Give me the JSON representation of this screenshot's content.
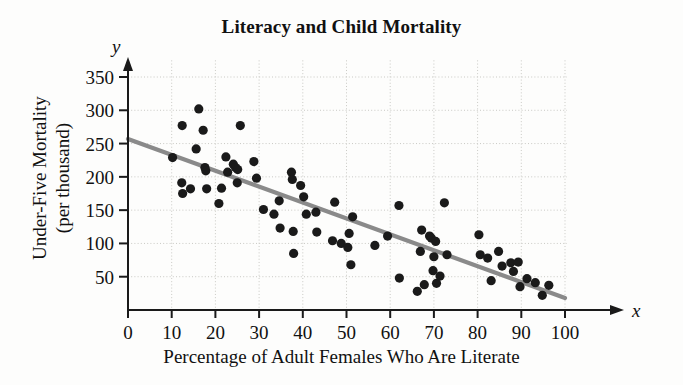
{
  "chart_data": {
    "type": "scatter",
    "title": "Literacy and Child Mortality",
    "xlabel": "Percentage of Adult Females Who Are Literate",
    "ylabel_line1": "Under-Five Mortality",
    "ylabel_line2": "(per thousand)",
    "x_var_symbol": "x",
    "y_var_symbol": "y",
    "xlim": [
      0,
      100
    ],
    "ylim": [
      0,
      375
    ],
    "xticks": [
      0,
      10,
      20,
      30,
      40,
      50,
      60,
      70,
      80,
      90,
      100
    ],
    "yticks": [
      50,
      100,
      150,
      200,
      250,
      300,
      350
    ],
    "grid": true,
    "grid_style": "dotted",
    "point_color": "#1a1a1a",
    "trendline_color": "#8a8a8a",
    "axis_color": "#1a1a1a",
    "trendline": {
      "label": "least-squares regression line",
      "x_start": 0,
      "y_start": 257,
      "x_end": 100,
      "y_end": 18
    },
    "points": [
      {
        "x": 10.2,
        "y": 229
      },
      {
        "x": 12.4,
        "y": 277
      },
      {
        "x": 12.3,
        "y": 191
      },
      {
        "x": 12.5,
        "y": 175
      },
      {
        "x": 14.3,
        "y": 182
      },
      {
        "x": 15.6,
        "y": 242
      },
      {
        "x": 16.2,
        "y": 302
      },
      {
        "x": 17.2,
        "y": 270
      },
      {
        "x": 17.6,
        "y": 214
      },
      {
        "x": 17.8,
        "y": 209
      },
      {
        "x": 18.0,
        "y": 182
      },
      {
        "x": 20.8,
        "y": 160
      },
      {
        "x": 21.4,
        "y": 183
      },
      {
        "x": 22.4,
        "y": 230
      },
      {
        "x": 22.8,
        "y": 207
      },
      {
        "x": 24.1,
        "y": 219
      },
      {
        "x": 24.6,
        "y": 214
      },
      {
        "x": 25.1,
        "y": 211
      },
      {
        "x": 25.0,
        "y": 191
      },
      {
        "x": 25.7,
        "y": 277
      },
      {
        "x": 28.8,
        "y": 223
      },
      {
        "x": 29.4,
        "y": 198
      },
      {
        "x": 31.0,
        "y": 151
      },
      {
        "x": 33.4,
        "y": 144
      },
      {
        "x": 34.6,
        "y": 164
      },
      {
        "x": 34.8,
        "y": 123
      },
      {
        "x": 37.4,
        "y": 207
      },
      {
        "x": 37.6,
        "y": 196
      },
      {
        "x": 37.8,
        "y": 118
      },
      {
        "x": 37.9,
        "y": 85
      },
      {
        "x": 39.5,
        "y": 187
      },
      {
        "x": 40.2,
        "y": 170
      },
      {
        "x": 40.8,
        "y": 144
      },
      {
        "x": 43.0,
        "y": 147
      },
      {
        "x": 43.2,
        "y": 117
      },
      {
        "x": 46.8,
        "y": 104
      },
      {
        "x": 47.3,
        "y": 162
      },
      {
        "x": 48.8,
        "y": 100
      },
      {
        "x": 50.3,
        "y": 94
      },
      {
        "x": 50.6,
        "y": 115
      },
      {
        "x": 51.0,
        "y": 68
      },
      {
        "x": 51.4,
        "y": 140
      },
      {
        "x": 56.5,
        "y": 97
      },
      {
        "x": 59.4,
        "y": 111
      },
      {
        "x": 62.0,
        "y": 157
      },
      {
        "x": 62.1,
        "y": 48
      },
      {
        "x": 66.2,
        "y": 28
      },
      {
        "x": 66.9,
        "y": 88
      },
      {
        "x": 67.2,
        "y": 120
      },
      {
        "x": 67.8,
        "y": 38
      },
      {
        "x": 69.0,
        "y": 111
      },
      {
        "x": 69.4,
        "y": 108
      },
      {
        "x": 69.8,
        "y": 59
      },
      {
        "x": 70.0,
        "y": 80
      },
      {
        "x": 70.4,
        "y": 103
      },
      {
        "x": 70.6,
        "y": 40
      },
      {
        "x": 71.4,
        "y": 51
      },
      {
        "x": 72.4,
        "y": 161
      },
      {
        "x": 73.0,
        "y": 83
      },
      {
        "x": 80.3,
        "y": 113
      },
      {
        "x": 80.6,
        "y": 83
      },
      {
        "x": 82.3,
        "y": 78
      },
      {
        "x": 83.1,
        "y": 44
      },
      {
        "x": 84.8,
        "y": 88
      },
      {
        "x": 85.6,
        "y": 66
      },
      {
        "x": 87.6,
        "y": 71
      },
      {
        "x": 88.2,
        "y": 58
      },
      {
        "x": 89.3,
        "y": 72
      },
      {
        "x": 89.7,
        "y": 35
      },
      {
        "x": 91.3,
        "y": 47
      },
      {
        "x": 93.2,
        "y": 41
      },
      {
        "x": 94.8,
        "y": 22
      },
      {
        "x": 96.3,
        "y": 37
      }
    ]
  }
}
